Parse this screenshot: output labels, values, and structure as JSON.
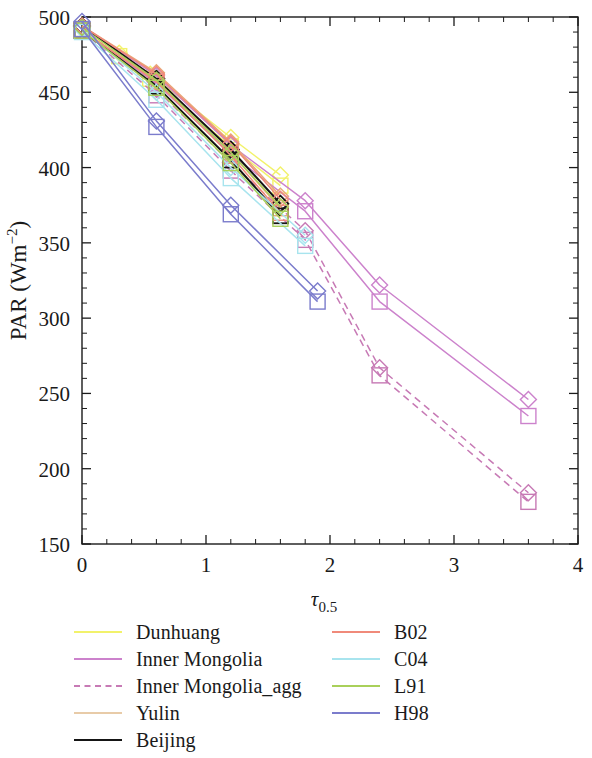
{
  "chart_data": {
    "type": "line",
    "title": "",
    "xlabel": "τ",
    "xlabel_sub": "0.5",
    "ylabel": "PAR (Wm",
    "ylabel_sup": "−2",
    "ylabel_close": ")",
    "xlim": [
      0,
      4
    ],
    "ylim": [
      150,
      500
    ],
    "xticks": [
      0,
      1,
      2,
      3,
      4
    ],
    "xtick_labels": [
      "0",
      "1",
      "2",
      "3",
      "4"
    ],
    "yticks": [
      150,
      200,
      250,
      300,
      350,
      400,
      450,
      500
    ],
    "ytick_labels": [
      "150",
      "200",
      "250",
      "300",
      "350",
      "400",
      "450",
      "500"
    ],
    "xminor_step": 0.2,
    "yminor_step": 10,
    "grid": false,
    "legend_position": "below-plot",
    "series": [
      {
        "name": "Dunhuang",
        "color": "#f2f26b",
        "dash": "solid",
        "marker": "diamond",
        "x": [
          0.0,
          0.3,
          0.55,
          1.2,
          1.6
        ],
        "y": [
          493,
          476,
          462,
          420,
          395
        ]
      },
      {
        "name": "Dunhuang_sq",
        "color": "#f2f26b",
        "dash": "solid",
        "marker": "square",
        "x": [
          0.0,
          0.3,
          0.55,
          1.2,
          1.6
        ],
        "y": [
          492,
          474,
          459,
          414,
          388
        ]
      },
      {
        "name": "Inner Mongolia",
        "color": "#cc82cc",
        "dash": "solid",
        "marker": "diamond",
        "x": [
          0.0,
          0.6,
          1.2,
          1.8,
          2.4,
          3.6
        ],
        "y": [
          494,
          461,
          415,
          378,
          322,
          246
        ]
      },
      {
        "name": "Inner Mongolia_sq",
        "color": "#cc82cc",
        "dash": "solid",
        "marker": "square",
        "x": [
          0.0,
          0.6,
          1.2,
          1.8,
          2.4,
          3.6
        ],
        "y": [
          491,
          456,
          409,
          371,
          311,
          235
        ]
      },
      {
        "name": "Inner Mongolia_agg",
        "color": "#c77ab5",
        "dash": "dashed",
        "marker": "diamond",
        "x": [
          0.0,
          0.6,
          1.2,
          1.8,
          2.4,
          3.6
        ],
        "y": [
          493,
          452,
          403,
          358,
          267,
          184
        ]
      },
      {
        "name": "Inner Mongolia_agg_sq",
        "color": "#c77ab5",
        "dash": "dashed",
        "marker": "square",
        "x": [
          0.0,
          0.6,
          1.2,
          1.8,
          2.4,
          3.6
        ],
        "y": [
          491,
          448,
          398,
          352,
          262,
          178
        ]
      },
      {
        "name": "Yulin",
        "color": "#e8a878",
        "dash": "solid",
        "marker": "diamond",
        "x": [
          0.0,
          0.6,
          1.2,
          1.6
        ],
        "y": [
          494,
          463,
          417,
          381
        ]
      },
      {
        "name": "Yulin_sq",
        "color": "#e8a878",
        "dash": "solid",
        "marker": "square",
        "x": [
          0.0,
          0.6,
          1.2,
          1.6
        ],
        "y": [
          491,
          458,
          410,
          373
        ]
      },
      {
        "name": "Beijing",
        "color": "#151515",
        "dash": "solid",
        "marker": "diamond",
        "x": [
          0.0,
          0.6,
          1.2,
          1.6
        ],
        "y": [
          494,
          459,
          412,
          376
        ]
      },
      {
        "name": "Beijing_sq",
        "color": "#151515",
        "dash": "solid",
        "marker": "square",
        "x": [
          0.0,
          0.6,
          1.2,
          1.6
        ],
        "y": [
          491,
          454,
          405,
          368
        ]
      },
      {
        "name": "B02",
        "color": "#f08a7a",
        "dash": "solid",
        "marker": "diamond",
        "x": [
          0.0,
          0.6,
          1.2,
          1.6
        ],
        "y": [
          494,
          462,
          416,
          379
        ]
      },
      {
        "name": "B02_sq",
        "color": "#f08a7a",
        "dash": "solid",
        "marker": "square",
        "x": [
          0.0,
          0.6,
          1.2,
          1.6
        ],
        "y": [
          491,
          457,
          408,
          370
        ]
      },
      {
        "name": "C04",
        "color": "#a8e4ee",
        "dash": "solid",
        "marker": "diamond",
        "x": [
          0.0,
          0.6,
          1.2,
          1.8
        ],
        "y": [
          492,
          450,
          400,
          355
        ]
      },
      {
        "name": "C04_sq",
        "color": "#a8e4ee",
        "dash": "solid",
        "marker": "square",
        "x": [
          0.0,
          0.6,
          1.2,
          1.8
        ],
        "y": [
          490,
          445,
          393,
          348
        ]
      },
      {
        "name": "L91",
        "color": "#a9d05a",
        "dash": "solid",
        "marker": "diamond",
        "x": [
          0.0,
          0.6,
          1.2,
          1.6
        ],
        "y": [
          493,
          458,
          410,
          374
        ]
      },
      {
        "name": "L91_sq",
        "color": "#a9d05a",
        "dash": "solid",
        "marker": "square",
        "x": [
          0.0,
          0.6,
          1.2,
          1.6
        ],
        "y": [
          491,
          453,
          403,
          366
        ]
      },
      {
        "name": "H98",
        "color": "#7b7ccc",
        "dash": "solid",
        "marker": "diamond",
        "x": [
          0.0,
          0.6,
          1.2,
          1.9
        ],
        "y": [
          497,
          431,
          375,
          318
        ]
      },
      {
        "name": "H98_sq",
        "color": "#7b7ccc",
        "dash": "solid",
        "marker": "square",
        "x": [
          0.0,
          0.6,
          1.2,
          1.9
        ],
        "y": [
          492,
          427,
          369,
          311
        ]
      }
    ]
  },
  "legend": {
    "left_column": [
      {
        "label": "Dunhuang",
        "color": "#f2f26b",
        "dash": "solid",
        "weight": "normal"
      },
      {
        "label": "Inner Mongolia",
        "color": "#cc82cc",
        "dash": "solid",
        "weight": "normal"
      },
      {
        "label": "Inner Mongolia_agg",
        "color": "#c77ab5",
        "dash": "dashed",
        "weight": "normal"
      },
      {
        "label": "Yulin",
        "color": "#e8cba8",
        "dash": "solid",
        "weight": "normal"
      },
      {
        "label": "Beijing",
        "color": "#151515",
        "dash": "solid",
        "weight": "thick"
      }
    ],
    "right_column": [
      {
        "label": "B02",
        "color": "#f08a7a",
        "dash": "solid",
        "weight": "normal"
      },
      {
        "label": "C04",
        "color": "#a8e4ee",
        "dash": "solid",
        "weight": "normal"
      },
      {
        "label": "L91",
        "color": "#a9d05a",
        "dash": "solid",
        "weight": "normal"
      },
      {
        "label": "H98",
        "color": "#7b7ccc",
        "dash": "solid",
        "weight": "normal"
      }
    ]
  },
  "axes": {
    "frame_color": "#1a1a1a",
    "tick_label_size": 21
  }
}
